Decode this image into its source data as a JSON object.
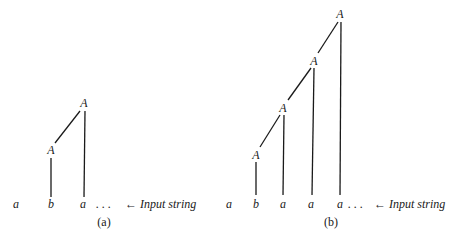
{
  "figure": {
    "line_color": "#1a1a1a",
    "panels": [
      {
        "id": "a",
        "caption": "(a)",
        "nonterminal": "A",
        "input_string": [
          "a",
          "b",
          "a"
        ],
        "ellipsis": ". . .",
        "annotation": "← Input string"
      },
      {
        "id": "b",
        "caption": "(b)",
        "nonterminal": "A",
        "input_string": [
          "a",
          "b",
          "a",
          "a",
          "a"
        ],
        "ellipsis": ". . .",
        "annotation": "← Input string"
      }
    ]
  }
}
